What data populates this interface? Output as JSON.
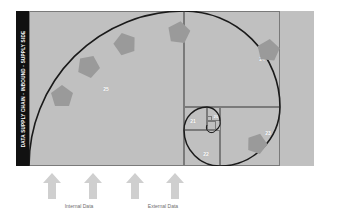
{
  "diagram": {
    "type": "fibonacci-golden-spiral",
    "title_bar": {
      "text": "DATA SUPPLY CHAIN - INBOUND - SUPPLY SIDE",
      "background_color": "#111111",
      "text_color": "#ffffff"
    },
    "background_color": "#c0c0c0",
    "line_color": "#7a7a7a",
    "spiral_color": "#1a1a1a",
    "marker_color": "#9a9a9a",
    "cells": [
      {
        "label": "25",
        "size_note": "largest square, left half"
      },
      {
        "label": "24",
        "size_note": "second square, upper right"
      },
      {
        "label": "23",
        "size_note": "third square, lower right"
      },
      {
        "label": "22",
        "size_note": "fourth square, lower middle"
      },
      {
        "label": "21",
        "size_note": "fifth square, middle"
      },
      {
        "label": "20",
        "size_note": "sixth square, smallest labelled"
      }
    ]
  },
  "inputs": {
    "arrow_color": "#cfcfcf",
    "arrows": [
      {
        "name": "arrow-1"
      },
      {
        "name": "arrow-2"
      },
      {
        "name": "arrow-3"
      },
      {
        "name": "arrow-4"
      }
    ],
    "captions": [
      {
        "label": "Internal Data"
      },
      {
        "label": "External Data"
      }
    ]
  }
}
